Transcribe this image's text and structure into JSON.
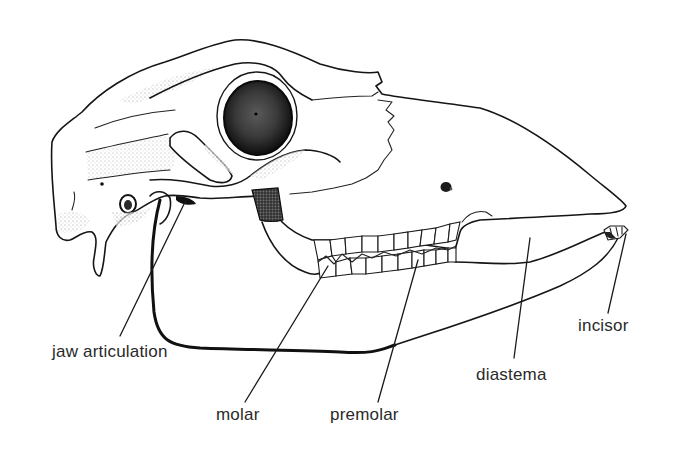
{
  "figure": {
    "style": "black ink line drawing with stippling",
    "colors": {
      "background": "#ffffff",
      "ink": "#151515",
      "label_text": "#2a2a2a"
    }
  },
  "labels": [
    {
      "id": "jaw-articulation",
      "text": "jaw articulation",
      "x": 52,
      "y": 343
    },
    {
      "id": "molar",
      "text": "molar",
      "x": 216,
      "y": 406
    },
    {
      "id": "premolar",
      "text": "premolar",
      "x": 330,
      "y": 406
    },
    {
      "id": "diastema",
      "text": "diastema",
      "x": 476,
      "y": 366
    },
    {
      "id": "incisor",
      "text": "incisor",
      "x": 578,
      "y": 317
    }
  ]
}
